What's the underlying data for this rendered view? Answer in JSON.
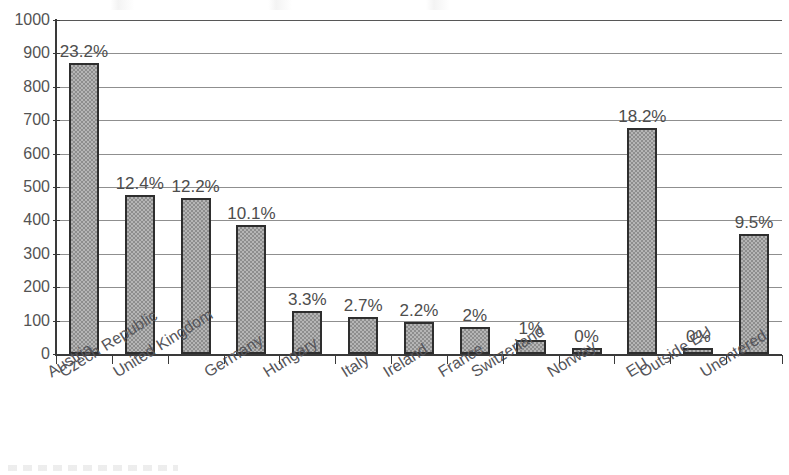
{
  "chart_data": {
    "type": "bar",
    "title": "",
    "subtitle": "",
    "xlabel": "",
    "ylabel": "",
    "ylim": [
      0,
      1000
    ],
    "y_ticks": [
      0,
      100,
      200,
      300,
      400,
      500,
      600,
      700,
      800,
      900,
      1000
    ],
    "grid": true,
    "legend": false,
    "categories": [
      "Austria",
      "Czech Republic",
      "United Kingdom",
      "Germany",
      "Hungary",
      "Italy",
      "Ireland",
      "France",
      "Switzerland",
      "Norway",
      "EU",
      "Outside EU",
      "Unentered"
    ],
    "values": [
      870,
      475,
      468,
      385,
      130,
      112,
      95,
      82,
      42,
      17,
      678,
      18,
      360
    ],
    "data_labels": [
      "23.2%",
      "12.4%",
      "12.2%",
      "10.1%",
      "3.3%",
      "2.7%",
      "2.2%",
      "2%",
      "1%",
      "0%",
      "18.2%",
      "0%",
      "9.5%"
    ],
    "colors": {
      "bar_fill": "#9b9b9b",
      "bar_border": "#2e2e2e",
      "grid": "#7b7b7b",
      "axis": "#3a3a3a",
      "text": "#4d4d4d",
      "background": "#ffffff"
    }
  }
}
